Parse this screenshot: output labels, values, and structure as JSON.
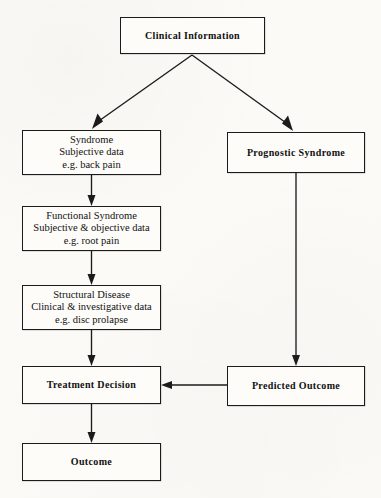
{
  "diagram": {
    "type": "flowchart",
    "background_color": "#fbfaf7",
    "line_color": "#1b1b1b",
    "nodes": [
      {
        "id": "clinical-information",
        "lines": [
          "Clinical Information"
        ],
        "emphasis": "bold",
        "x": 120,
        "y": 17,
        "w": 145,
        "h": 37,
        "font_size": 10
      },
      {
        "id": "syndrome",
        "lines": [
          "Syndrome",
          "Subjective data",
          "e.g. back pain"
        ],
        "emphasis": "plain",
        "x": 22,
        "y": 130,
        "w": 139,
        "h": 45,
        "font_size": 10.5
      },
      {
        "id": "prognostic-syndrome",
        "lines": [
          "Prognostic Syndrome"
        ],
        "emphasis": "bold",
        "x": 227,
        "y": 132,
        "w": 138,
        "h": 41,
        "font_size": 10
      },
      {
        "id": "functional-syndrome",
        "lines": [
          "Functional Syndrome",
          "Subjective & objective data",
          "e.g. root pain"
        ],
        "emphasis": "plain",
        "x": 22,
        "y": 206,
        "w": 139,
        "h": 45,
        "font_size": 10.5
      },
      {
        "id": "structural-disease",
        "lines": [
          "Structural Disease",
          "Clinical & investigative data",
          "e.g. disc prolapse"
        ],
        "emphasis": "plain",
        "x": 22,
        "y": 285,
        "w": 139,
        "h": 45,
        "font_size": 10.5
      },
      {
        "id": "treatment-decision",
        "lines": [
          "Treatment Decision"
        ],
        "emphasis": "bold",
        "x": 22,
        "y": 366,
        "w": 139,
        "h": 38,
        "font_size": 10
      },
      {
        "id": "predicted-outcome",
        "lines": [
          "Predicted Outcome"
        ],
        "emphasis": "bold",
        "x": 227,
        "y": 366,
        "w": 138,
        "h": 40,
        "font_size": 10
      },
      {
        "id": "outcome",
        "lines": [
          "Outcome"
        ],
        "emphasis": "bold",
        "x": 22,
        "y": 443,
        "w": 139,
        "h": 38,
        "font_size": 10
      }
    ],
    "edges": [
      {
        "id": "edge-clinical-to-syndrome",
        "from": "clinical-information",
        "to": "syndrome",
        "shape": "diagonal",
        "direction": "down-left"
      },
      {
        "id": "edge-clinical-to-prognostic",
        "from": "clinical-information",
        "to": "prognostic-syndrome",
        "shape": "diagonal",
        "direction": "down-right"
      },
      {
        "id": "edge-syndrome-to-functional",
        "from": "syndrome",
        "to": "functional-syndrome",
        "shape": "vertical",
        "direction": "down"
      },
      {
        "id": "edge-functional-to-structural",
        "from": "functional-syndrome",
        "to": "structural-disease",
        "shape": "vertical",
        "direction": "down"
      },
      {
        "id": "edge-structural-to-treatment",
        "from": "structural-disease",
        "to": "treatment-decision",
        "shape": "vertical",
        "direction": "down"
      },
      {
        "id": "edge-prognostic-to-predicted",
        "from": "prognostic-syndrome",
        "to": "predicted-outcome",
        "shape": "vertical",
        "direction": "down"
      },
      {
        "id": "edge-predicted-to-treatment",
        "from": "predicted-outcome",
        "to": "treatment-decision",
        "shape": "horizontal",
        "direction": "left"
      },
      {
        "id": "edge-treatment-to-outcome",
        "from": "treatment-decision",
        "to": "outcome",
        "shape": "vertical",
        "direction": "down"
      }
    ]
  }
}
